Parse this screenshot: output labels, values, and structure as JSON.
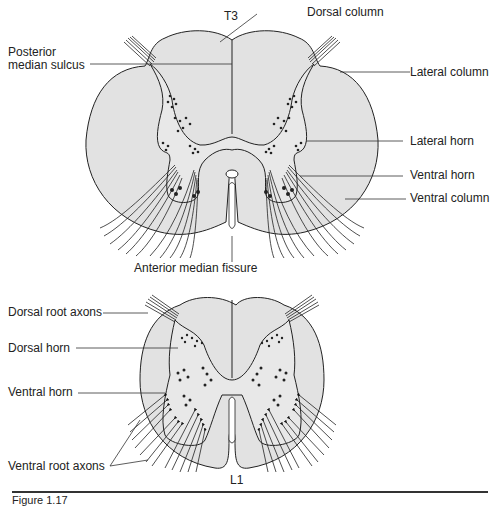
{
  "figure": {
    "caption_partial": "Figure 1.17",
    "fill_color": "#e2e2e2",
    "grey_matter_color": "#e8e8e8",
    "stroke_color": "#222222",
    "top_section": {
      "level_label": "T3",
      "labels": {
        "posterior_median_sulcus": "Posterior median sulcus",
        "dorsal_column": "Dorsal column",
        "lateral_column": "Lateral column",
        "lateral_horn": "Lateral horn",
        "ventral_horn": "Ventral horn",
        "ventral_column": "Ventral column",
        "anterior_median_fissure": "Anterior median fissure"
      }
    },
    "bottom_section": {
      "level_label": "L1",
      "labels": {
        "dorsal_root_axons": "Dorsal root axons",
        "dorsal_horn": "Dorsal horn",
        "ventral_horn": "Ventral horn",
        "ventral_root_axons": "Ventral root axons"
      }
    }
  }
}
